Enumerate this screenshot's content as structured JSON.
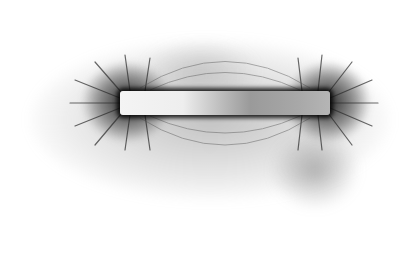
{
  "image": {
    "subject": "Iron filings aligned along the magnetic field of a bar magnet",
    "background_color": "#ffffff",
    "filings_color": "#333333",
    "magnet": {
      "x": 120,
      "y": 91,
      "width": 210,
      "height": 24,
      "left_pole_color": "#f4f4f4",
      "right_pole_color": "#a8a8a8"
    }
  }
}
